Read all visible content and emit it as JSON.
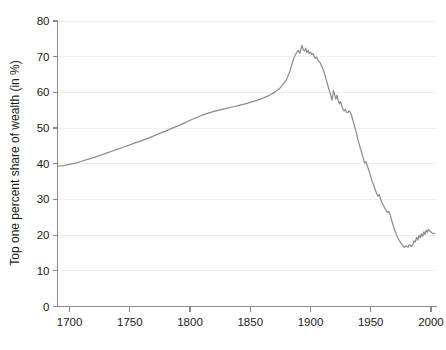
{
  "chart_data": {
    "type": "line",
    "title": "",
    "xlabel": "",
    "ylabel": "Top one percent share of wealth (in %)",
    "xlim": [
      1690,
      2005
    ],
    "ylim": [
      0,
      80
    ],
    "grid": true,
    "legend": "none",
    "xticks": [
      1700,
      1750,
      1800,
      1850,
      1900,
      1950,
      2000
    ],
    "xtick_labels": [
      "1700",
      "1750",
      "1800",
      "1850",
      "1900",
      "1950",
      "2000"
    ],
    "yticks": [
      0,
      10,
      20,
      30,
      40,
      50,
      60,
      70,
      80
    ],
    "ytick_labels": [
      "0",
      "10",
      "20",
      "30",
      "40",
      "50",
      "60",
      "70",
      "80"
    ],
    "series": [
      {
        "name": "Top one percent share of wealth",
        "color": "#8d8d8d",
        "x": [
          1690,
          1695,
          1700,
          1705,
          1710,
          1715,
          1720,
          1725,
          1730,
          1735,
          1740,
          1745,
          1750,
          1755,
          1760,
          1765,
          1770,
          1775,
          1780,
          1785,
          1790,
          1795,
          1800,
          1805,
          1810,
          1815,
          1820,
          1825,
          1830,
          1835,
          1840,
          1845,
          1850,
          1855,
          1860,
          1865,
          1870,
          1875,
          1880,
          1883,
          1885,
          1887,
          1889,
          1890,
          1891,
          1892,
          1893,
          1894,
          1895,
          1896,
          1897,
          1898,
          1899,
          1900,
          1901,
          1902,
          1903,
          1904,
          1905,
          1906,
          1907,
          1908,
          1909,
          1910,
          1911,
          1912,
          1913,
          1914,
          1915,
          1916,
          1917,
          1918,
          1919,
          1920,
          1921,
          1922,
          1923,
          1924,
          1925,
          1926,
          1927,
          1928,
          1929,
          1930,
          1931,
          1932,
          1933,
          1934,
          1935,
          1936,
          1937,
          1938,
          1939,
          1940,
          1941,
          1942,
          1943,
          1944,
          1945,
          1946,
          1947,
          1948,
          1949,
          1950,
          1951,
          1952,
          1953,
          1954,
          1955,
          1956,
          1957,
          1958,
          1959,
          1960,
          1961,
          1962,
          1963,
          1964,
          1965,
          1966,
          1967,
          1968,
          1969,
          1970,
          1971,
          1972,
          1973,
          1974,
          1975,
          1976,
          1977,
          1978,
          1979,
          1980,
          1981,
          1982,
          1983,
          1984,
          1985,
          1986,
          1987,
          1988,
          1989,
          1990,
          1991,
          1992,
          1993,
          1994,
          1995,
          1996,
          1997,
          1998,
          1999,
          2000,
          2001,
          2002,
          2003
        ],
        "y": [
          39.3,
          39.5,
          39.8,
          40.2,
          40.7,
          41.2,
          41.7,
          42.3,
          42.9,
          43.5,
          44.1,
          44.7,
          45.3,
          45.9,
          46.5,
          47.1,
          47.8,
          48.5,
          49.2,
          49.9,
          50.6,
          51.4,
          52.2,
          52.9,
          53.6,
          54.2,
          54.7,
          55.1,
          55.5,
          55.9,
          56.3,
          56.7,
          57.2,
          57.7,
          58.3,
          59.0,
          60.0,
          61.3,
          63.5,
          66.0,
          68.4,
          70.3,
          71.4,
          71.8,
          70.9,
          72.0,
          73.2,
          71.9,
          71.6,
          72.4,
          71.2,
          71.8,
          70.9,
          71.3,
          70.6,
          70.9,
          70.1,
          69.6,
          69.9,
          69.2,
          68.7,
          68.3,
          67.6,
          66.8,
          65.9,
          64.8,
          63.6,
          62.4,
          61.2,
          60.1,
          58.9,
          57.8,
          60.5,
          59.4,
          58.1,
          59.2,
          57.8,
          56.8,
          57.4,
          56.2,
          55.3,
          54.8,
          55.2,
          54.4,
          54.3,
          54.8,
          54.5,
          53.6,
          52.4,
          51.2,
          50.0,
          48.7,
          47.3,
          46.0,
          44.8,
          43.6,
          42.4,
          41.3,
          40.2,
          40.6,
          39.6,
          38.6,
          37.5,
          36.4,
          35.3,
          34.3,
          33.4,
          32.5,
          31.6,
          30.9,
          31.4,
          30.3,
          29.3,
          28.6,
          28.0,
          27.4,
          26.8,
          26.4,
          26.7,
          25.8,
          24.6,
          23.4,
          22.3,
          21.3,
          20.4,
          19.6,
          18.9,
          18.3,
          17.8,
          17.3,
          16.9,
          16.6,
          17.0,
          16.8,
          16.6,
          17.3,
          17.0,
          16.8,
          17.5,
          18.4,
          18.1,
          19.4,
          18.6,
          19.9,
          19.2,
          20.4,
          19.6,
          20.9,
          20.2,
          21.4,
          20.8,
          21.6,
          21.2,
          20.9,
          20.6,
          20.4,
          20.5
        ]
      }
    ]
  },
  "axes": {
    "y_axis_title": "Top one percent share of wealth (in %)"
  }
}
